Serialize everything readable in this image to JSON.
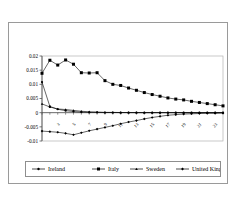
{
  "figure": {
    "border_color": "#9a9a9a",
    "background": "#ffffff"
  },
  "chart_data": {
    "type": "line",
    "title": "",
    "subtitle": "",
    "xlabel": "",
    "ylabel": "",
    "grid": false,
    "legend_position": "bottom",
    "ylim": [
      -0.01,
      0.02
    ],
    "xlim": [
      1,
      24
    ],
    "ytick_labels": [
      "0.02",
      "0.015",
      "0.01",
      "0.005",
      "0",
      "-0.005",
      "-0.01"
    ],
    "ytick_values": [
      0.02,
      0.015,
      0.01,
      0.005,
      0,
      -0.005,
      -0.01
    ],
    "xtick_labels": [
      "3",
      "5",
      "7",
      "9",
      "11",
      "13",
      "15",
      "17",
      "19",
      "21",
      "23"
    ],
    "xtick_values": [
      3,
      5,
      7,
      9,
      11,
      13,
      15,
      17,
      19,
      21,
      23
    ],
    "x": [
      1,
      2,
      3,
      4,
      5,
      6,
      7,
      8,
      9,
      10,
      11,
      12,
      13,
      14,
      15,
      16,
      17,
      18,
      19,
      20,
      21,
      22,
      23,
      24
    ],
    "series": [
      {
        "name": "Ireland",
        "marker": "circle",
        "color": "#000000",
        "values": [
          0.0108,
          0.0022,
          0.0012,
          0.0007,
          0.0004,
          0.0002,
          0.0001,
          0.0001,
          5e-05,
          5e-05,
          3e-05,
          2e-05,
          2e-05,
          1e-05,
          1e-05,
          1e-05,
          1e-05,
          1e-05,
          5e-06,
          5e-06,
          5e-06,
          5e-06,
          5e-06,
          5e-06
        ]
      },
      {
        "name": "Italy",
        "marker": "square",
        "color": "#000000",
        "values": [
          0.0139,
          0.0185,
          0.0168,
          0.0186,
          0.0171,
          0.0141,
          0.014,
          0.0141,
          0.0113,
          0.01,
          0.0096,
          0.0087,
          0.0079,
          0.0071,
          0.0064,
          0.0058,
          0.0052,
          0.0048,
          0.0045,
          0.004,
          0.0036,
          0.0032,
          0.0028,
          0.0024
        ]
      },
      {
        "name": "Sweden",
        "marker": "triangle",
        "color": "#000000",
        "values": [
          0.0031,
          0.002,
          0.0013,
          0.0011,
          0.0008,
          0.0005,
          0.0003,
          0.0002,
          0.0001,
          0.0001,
          5e-05,
          5e-05,
          3e-05,
          2e-05,
          2e-05,
          1e-05,
          1e-05,
          1e-05,
          1e-05,
          5e-06,
          5e-06,
          5e-06,
          5e-06,
          5e-06
        ]
      },
      {
        "name": "United Kingdom",
        "marker": "diamond",
        "color": "#000000",
        "values": [
          -0.0065,
          -0.0067,
          -0.0069,
          -0.0073,
          -0.0078,
          -0.0071,
          -0.0064,
          -0.0058,
          -0.0052,
          -0.0046,
          -0.0039,
          -0.0033,
          -0.0028,
          -0.0022,
          -0.0017,
          -0.0013,
          -0.0009,
          -0.0007,
          -0.0005,
          -0.0004,
          -0.0003,
          -0.0002,
          -0.0002,
          -0.0001
        ]
      }
    ]
  },
  "legend": {
    "items": [
      {
        "label": "Ireland",
        "marker": "circle"
      },
      {
        "label": "Italy",
        "marker": "square"
      },
      {
        "label": "Sweden",
        "marker": "triangle"
      },
      {
        "label": "United Kingdom",
        "marker": "diamond"
      }
    ]
  }
}
